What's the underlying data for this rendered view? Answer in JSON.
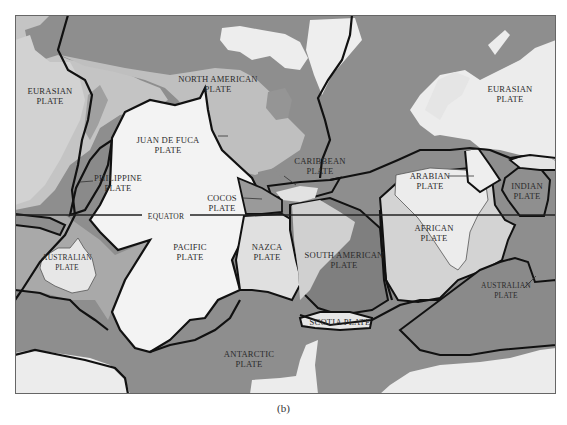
{
  "figure": {
    "caption": "(b)",
    "colors": {
      "ocean_dark": "#8e8e8e",
      "ocean_mid": "#a9a9a9",
      "land_light": "#e9e9e9",
      "pacific_plate": "#f3f3f3",
      "boundary": "#111111",
      "frame": "#666666"
    }
  },
  "equator": {
    "label": "EQUATOR"
  },
  "plates": [
    {
      "id": "eurasian-west",
      "line1": "EURASIAN",
      "line2": "PLATE"
    },
    {
      "id": "north-american",
      "line1": "NORTH AMERICAN",
      "line2": "PLATE"
    },
    {
      "id": "eurasian-east",
      "line1": "EURASIAN",
      "line2": "PLATE"
    },
    {
      "id": "juan-de-fuca",
      "line1": "JUAN DE FUCA",
      "line2": "PLATE"
    },
    {
      "id": "philippine",
      "line1": "PHILIPPINE",
      "line2": "PLATE"
    },
    {
      "id": "caribbean",
      "line1": "CARIBBEAN",
      "line2": "PLATE"
    },
    {
      "id": "cocos",
      "line1": "COCOS",
      "line2": "PLATE"
    },
    {
      "id": "arabian",
      "line1": "ARABIAN",
      "line2": "PLATE"
    },
    {
      "id": "indian",
      "line1": "INDIAN",
      "line2": "PLATE"
    },
    {
      "id": "australian-west",
      "line1": "AUSTRALIAN",
      "line2": "PLATE"
    },
    {
      "id": "pacific",
      "line1": "PACIFIC",
      "line2": "PLATE"
    },
    {
      "id": "nazca",
      "line1": "NAZCA",
      "line2": "PLATE"
    },
    {
      "id": "south-american",
      "line1": "SOUTH AMERICAN",
      "line2": "PLATE"
    },
    {
      "id": "african",
      "line1": "AFRICAN",
      "line2": "PLATE"
    },
    {
      "id": "australian-east",
      "line1": "AUSTRALIAN",
      "line2": "PLATE"
    },
    {
      "id": "scotia",
      "line1": "SCOTIA PLATE",
      "line2": ""
    },
    {
      "id": "antarctic",
      "line1": "ANTARCTIC",
      "line2": "PLATE"
    }
  ]
}
